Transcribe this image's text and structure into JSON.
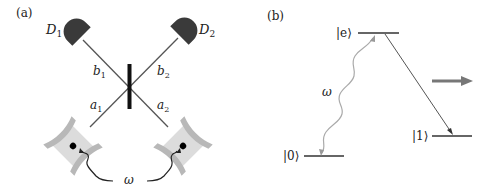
{
  "panel_a": {
    "label": "(a)",
    "detectors": [
      {
        "name": "D",
        "sub": "1"
      },
      {
        "name": "D",
        "sub": "2"
      }
    ],
    "modes": [
      {
        "name": "b",
        "sub": "1"
      },
      {
        "name": "b",
        "sub": "2"
      },
      {
        "name": "a",
        "sub": "1"
      },
      {
        "name": "a",
        "sub": "2"
      }
    ],
    "drive_label": "ω"
  },
  "panel_b": {
    "label": "(b)",
    "levels": {
      "excited": "|e⟩",
      "ground0": "|0⟩",
      "ground1": "|1⟩"
    },
    "drive_label": "ω"
  },
  "colors": {
    "detector": "#3a3a3a",
    "beam": "#555555",
    "splitter": "#111111",
    "cavity_mirror": "#b8b8b8",
    "cavity_fill": "#dcdcdc",
    "photon_wavy_a": "#222222",
    "photon_wavy_b": "#aaaaaa",
    "arrow": "#777777"
  }
}
